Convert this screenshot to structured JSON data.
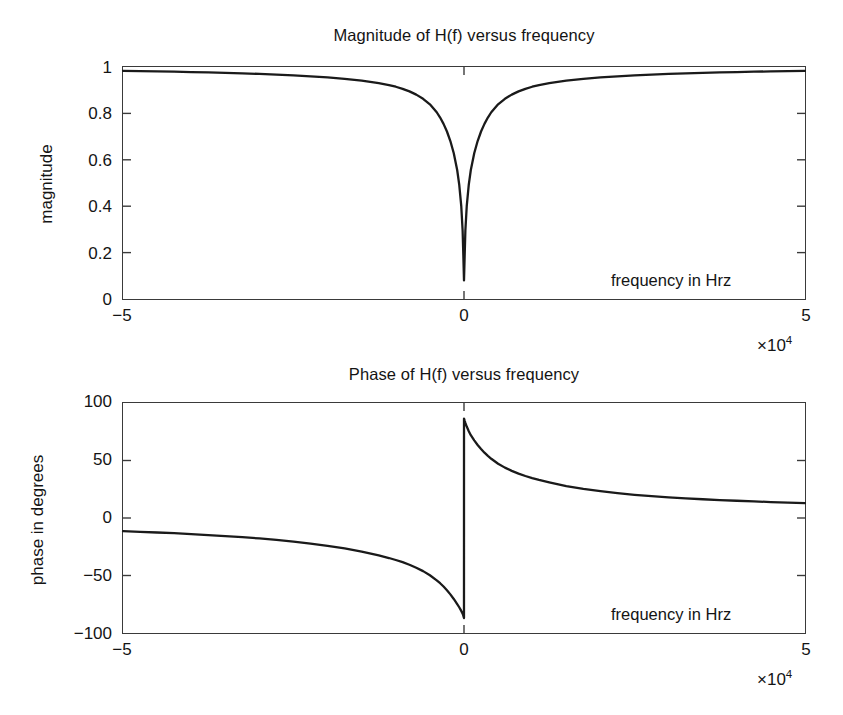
{
  "figure": {
    "background_color": "#ffffff",
    "line_color": "#1a1a1a",
    "axis_color": "#3a3a3a"
  },
  "panels": [
    {
      "id": "magnitude",
      "title": "Magnitude of H(f) versus frequency",
      "ylabel": "magnitude",
      "inplot_label": "frequency in Hrz",
      "exponent_times": "×10",
      "exponent_power": "4",
      "ytick_labels": [
        "1",
        "0.8",
        "0.6",
        "0.4",
        "0.2",
        "0"
      ],
      "xtick_labels": [
        "−5",
        "5"
      ]
    },
    {
      "id": "phase",
      "title": "Phase of H(f) versus frequency",
      "ylabel": "phase in degrees",
      "inplot_label": "frequency in Hrz",
      "exponent_times": "×10",
      "exponent_power": "4",
      "ytick_labels": [
        "100",
        "50",
        "0",
        "−50",
        "−100"
      ],
      "xtick_labels": [
        "−5",
        "5"
      ]
    }
  ],
  "chart_data": [
    {
      "type": "line",
      "id": "magnitude",
      "title": "Magnitude of H(f) versus frequency",
      "xlabel": "frequency in Hrz",
      "ylabel": "magnitude",
      "x_multiplier": "×10^4",
      "xlim": [
        -50000,
        50000
      ],
      "ylim": [
        0,
        1
      ],
      "xticks": [
        -50000,
        0,
        50000
      ],
      "xticklabels": [
        "−5",
        "0",
        "5"
      ],
      "yticks": [
        0,
        0.2,
        0.4,
        0.6,
        0.8,
        1
      ],
      "yticklabels": [
        "0",
        "0.2",
        "0.4",
        "0.6",
        "0.8",
        "1"
      ],
      "grid": false,
      "legend": false,
      "series": [
        {
          "name": "|H(f)|",
          "x": [
            -50000,
            -47500,
            -45000,
            -42500,
            -40000,
            -37500,
            -35000,
            -32500,
            -30000,
            -27500,
            -25000,
            -22500,
            -20000,
            -17500,
            -15000,
            -12500,
            -11000,
            -10000,
            -9000,
            -8000,
            -7000,
            -6000,
            -5000,
            -4000,
            -3500,
            -3000,
            -2500,
            -2000,
            -1500,
            -1000,
            -700,
            -400,
            -200,
            -100,
            0,
            100,
            200,
            400,
            700,
            1000,
            1500,
            2000,
            2500,
            3000,
            3500,
            4000,
            5000,
            6000,
            7000,
            8000,
            9000,
            10000,
            11000,
            12500,
            15000,
            17500,
            20000,
            22500,
            25000,
            27500,
            30000,
            32500,
            35000,
            37500,
            40000,
            42500,
            45000,
            47500,
            50000
          ],
          "y": [
            0.983,
            0.982,
            0.981,
            0.98,
            0.978,
            0.977,
            0.975,
            0.973,
            0.97,
            0.967,
            0.964,
            0.96,
            0.955,
            0.949,
            0.941,
            0.93,
            0.922,
            0.915,
            0.906,
            0.895,
            0.881,
            0.863,
            0.839,
            0.805,
            0.782,
            0.755,
            0.722,
            0.681,
            0.628,
            0.556,
            0.493,
            0.4,
            0.294,
            0.19,
            0.08,
            0.19,
            0.294,
            0.4,
            0.493,
            0.556,
            0.628,
            0.681,
            0.722,
            0.755,
            0.782,
            0.805,
            0.839,
            0.863,
            0.881,
            0.895,
            0.906,
            0.915,
            0.922,
            0.93,
            0.941,
            0.949,
            0.955,
            0.96,
            0.964,
            0.967,
            0.97,
            0.973,
            0.975,
            0.977,
            0.978,
            0.98,
            0.981,
            0.982,
            0.983
          ]
        }
      ],
      "annotations": [
        {
          "text": "frequency in Hrz",
          "x": 22000,
          "y": 0.115
        }
      ]
    },
    {
      "type": "line",
      "id": "phase",
      "title": "Phase of H(f) versus frequency",
      "xlabel": "frequency in Hrz",
      "ylabel": "phase in degrees",
      "x_multiplier": "×10^4",
      "xlim": [
        -50000,
        50000
      ],
      "ylim": [
        -100,
        100
      ],
      "xticks": [
        -50000,
        0,
        50000
      ],
      "xticklabels": [
        "−5",
        "0",
        "5"
      ],
      "yticks": [
        -100,
        -50,
        0,
        50,
        100
      ],
      "yticklabels": [
        "−100",
        "−50",
        "0",
        "50",
        "100"
      ],
      "grid": false,
      "legend": false,
      "series": [
        {
          "name": "∠H(f)",
          "x": [
            -50000,
            -47500,
            -45000,
            -42500,
            -40000,
            -37500,
            -35000,
            -32500,
            -30000,
            -27500,
            -25000,
            -22500,
            -20000,
            -17500,
            -15000,
            -12500,
            -11000,
            -10000,
            -9000,
            -8000,
            -7000,
            -6000,
            -5000,
            -4000,
            -3500,
            -3000,
            -2500,
            -2000,
            -1500,
            -1000,
            -700,
            -400,
            -200,
            -100,
            -50,
            -1,
            1,
            50,
            100,
            200,
            400,
            700,
            1000,
            1500,
            2000,
            2500,
            3000,
            3500,
            4000,
            5000,
            6000,
            7000,
            8000,
            9000,
            10000,
            11000,
            12500,
            15000,
            17500,
            20000,
            22500,
            25000,
            27500,
            30000,
            32500,
            35000,
            37500,
            40000,
            42500,
            45000,
            47500,
            50000
          ],
          "y": [
            -11.5,
            -12.0,
            -12.6,
            -13.2,
            -14.0,
            -14.8,
            -15.7,
            -16.7,
            -17.8,
            -19.1,
            -20.5,
            -22.2,
            -24.2,
            -26.5,
            -29.2,
            -32.5,
            -34.8,
            -36.5,
            -38.4,
            -40.6,
            -43.2,
            -46.2,
            -49.8,
            -54.2,
            -56.7,
            -59.6,
            -62.8,
            -66.4,
            -70.4,
            -74.8,
            -77.6,
            -80.8,
            -83.2,
            -85.0,
            -86.0,
            -87.0,
            86.5,
            85.5,
            84.5,
            82.7,
            79.5,
            75.5,
            72.0,
            67.5,
            63.5,
            60.0,
            56.8,
            54.0,
            51.5,
            47.2,
            43.8,
            41.0,
            38.6,
            36.5,
            34.7,
            33.1,
            31.0,
            27.8,
            25.3,
            23.3,
            21.6,
            20.2,
            19.0,
            18.0,
            17.1,
            16.3,
            15.6,
            15.0,
            14.4,
            13.9,
            13.4,
            13.0
          ]
        }
      ],
      "annotations": [
        {
          "text": "frequency in Hrz",
          "x": 22000,
          "y": -81
        }
      ]
    }
  ]
}
